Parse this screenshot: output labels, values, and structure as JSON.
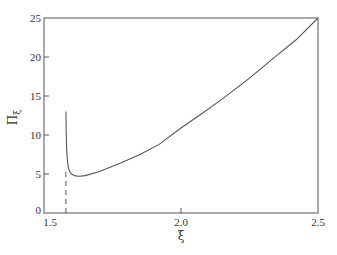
{
  "chart_data": {
    "type": "line",
    "title": "",
    "xlabel": "ξ",
    "ylabel": "Πξ",
    "ylabel_main": "Π",
    "ylabel_sub": "ξ",
    "xlim": [
      1.5,
      2.5
    ],
    "ylim": [
      0,
      25
    ],
    "grid": false,
    "legend": null,
    "x_ticks": [
      1.5,
      2.0,
      2.5
    ],
    "x_tick_labels": [
      "1.5",
      "2.0",
      "2.5"
    ],
    "y_ticks": [
      0,
      5,
      10,
      15,
      20,
      25
    ],
    "y_tick_labels": [
      "0",
      "5",
      "10",
      "15",
      "20",
      "25"
    ],
    "series": [
      {
        "name": "Πξ",
        "style": "solid",
        "x": [
          1.58,
          1.581,
          1.583,
          1.586,
          1.59,
          1.6,
          1.615,
          1.63,
          1.65,
          1.7,
          1.78,
          1.85,
          1.92,
          2.0,
          2.07,
          2.15,
          2.25,
          2.35,
          2.42,
          2.5
        ],
        "y": [
          13.0,
          10.5,
          8.0,
          6.5,
          5.6,
          5.0,
          4.75,
          4.7,
          4.8,
          5.3,
          6.4,
          7.5,
          8.8,
          10.9,
          12.6,
          14.6,
          17.3,
          20.2,
          22.2,
          25.0
        ]
      }
    ],
    "annotations": [
      {
        "type": "vertical-dashed-line",
        "x": 1.58,
        "y_from": 0,
        "y_to": 5.8
      }
    ]
  },
  "colors": {
    "axis": "#555555",
    "curve": "#555555",
    "background": "#ffffff"
  }
}
